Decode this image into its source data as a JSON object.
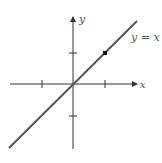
{
  "diagram": {
    "type": "graph",
    "x_axis_label": "x",
    "y_axis_label": "y",
    "line_label": "y = x",
    "line_equation": "y = x",
    "origin": [
      0,
      0
    ],
    "ticks_x": [
      -1,
      1
    ],
    "ticks_y": [
      -1,
      1
    ],
    "highlighted_point": [
      1,
      1
    ],
    "colors": {
      "axis": "#333333",
      "line": "#555555",
      "point": "#111111",
      "label": "#555555"
    }
  }
}
